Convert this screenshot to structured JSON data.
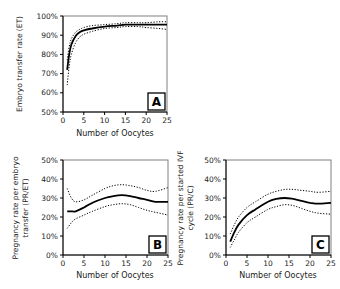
{
  "chart_data": [
    {
      "panel": "A",
      "type": "line",
      "title": "",
      "xlabel": "Number of Oocytes",
      "ylabel": "Embryo transfer rate (ET)",
      "xlim": [
        0,
        25
      ],
      "ylim": [
        50,
        100
      ],
      "x_ticks": [
        "0",
        "5",
        "10",
        "15",
        "20",
        "25"
      ],
      "y_ticks": [
        "50%",
        "60%",
        "70%",
        "80%",
        "90%",
        "100%"
      ],
      "grid": false,
      "legend": null,
      "x": [
        1,
        1.5,
        2,
        3,
        4,
        5,
        7,
        10,
        13,
        15,
        18,
        20,
        23,
        25
      ],
      "series": [
        {
          "name": "estimate",
          "style": "solid",
          "values": [
            72,
            80,
            85,
            89.5,
            91.5,
            92.5,
            93.5,
            94.5,
            95,
            95.5,
            95.5,
            95.5,
            95.5,
            95.5
          ]
        },
        {
          "name": "upper CI",
          "style": "dotted",
          "values": [
            77,
            84,
            88,
            91.5,
            93,
            94,
            95,
            95.5,
            96,
            96.5,
            96.5,
            96.5,
            97,
            97
          ]
        },
        {
          "name": "lower CI",
          "style": "dotted",
          "values": [
            64,
            74,
            80,
            86,
            89,
            90.5,
            92,
            93.5,
            94,
            94.5,
            94.5,
            94,
            93.5,
            93
          ]
        }
      ]
    },
    {
      "panel": "B",
      "type": "line",
      "title": "",
      "xlabel": "Number of Oocytes",
      "ylabel": "Pregnancy rate per embryo transfer (PR/ET)",
      "xlim": [
        0,
        25
      ],
      "ylim": [
        0,
        50
      ],
      "x_ticks": [
        "0",
        "5",
        "10",
        "15",
        "20",
        "25"
      ],
      "y_ticks": [
        "0%",
        "10%",
        "20%",
        "30%",
        "40%",
        "50%"
      ],
      "grid": false,
      "legend": null,
      "x": [
        1,
        2,
        3,
        5,
        7,
        10,
        12,
        14,
        16,
        18,
        20,
        22,
        25
      ],
      "series": [
        {
          "name": "estimate",
          "style": "solid",
          "values": [
            23,
            23,
            23,
            25,
            27.5,
            30,
            31,
            31.5,
            31,
            30,
            29,
            28,
            28
          ]
        },
        {
          "name": "upper CI",
          "style": "dotted",
          "values": [
            35,
            30,
            28,
            29,
            31.5,
            35,
            36.5,
            37,
            36.5,
            35.5,
            34,
            33.5,
            35.5
          ]
        },
        {
          "name": "lower CI",
          "style": "dotted",
          "values": [
            14,
            17,
            19,
            21,
            23,
            25.5,
            26.5,
            27,
            26.5,
            25,
            23.5,
            22.5,
            21
          ]
        }
      ]
    },
    {
      "panel": "C",
      "type": "line",
      "title": "",
      "xlabel": "Number of Oocytes",
      "ylabel": "Pregnancy rate per started IVF cycle (PR/C)",
      "xlim": [
        0,
        25
      ],
      "ylim": [
        0,
        50
      ],
      "x_ticks": [
        "0",
        "5",
        "10",
        "15",
        "20",
        "25"
      ],
      "y_ticks": [
        "0%",
        "10%",
        "20%",
        "30%",
        "40%",
        "50%"
      ],
      "grid": false,
      "legend": null,
      "x": [
        1,
        2,
        3,
        5,
        7,
        10,
        12,
        14,
        16,
        18,
        20,
        22,
        25
      ],
      "series": [
        {
          "name": "estimate",
          "style": "solid",
          "values": [
            7,
            12,
            16,
            21,
            24,
            28,
            29.5,
            30,
            29.5,
            28.5,
            27.5,
            27,
            27.5
          ]
        },
        {
          "name": "upper CI",
          "style": "dotted",
          "values": [
            11,
            16,
            20,
            25,
            28,
            32,
            33.5,
            34.5,
            34.5,
            34,
            33.5,
            33,
            33.5
          ]
        },
        {
          "name": "lower CI",
          "style": "dotted",
          "values": [
            4,
            8,
            12,
            17,
            20,
            24,
            25.5,
            26.5,
            26,
            24.5,
            23,
            22,
            21.5
          ]
        }
      ]
    }
  ],
  "labels": {
    "panel_a": "A",
    "panel_b": "B",
    "panel_c": "C",
    "xlabel": "Number of Oocytes",
    "ylabel_a": "Embryo transfer rate (ET)",
    "ylabel_b_line1": "Pregnancy rate per embryo",
    "ylabel_b_line2": "transfer (PR/ET)",
    "ylabel_c_line1": "Pregnancy rate per started IVF",
    "ylabel_c_line2": "cycle (PR/C)"
  }
}
